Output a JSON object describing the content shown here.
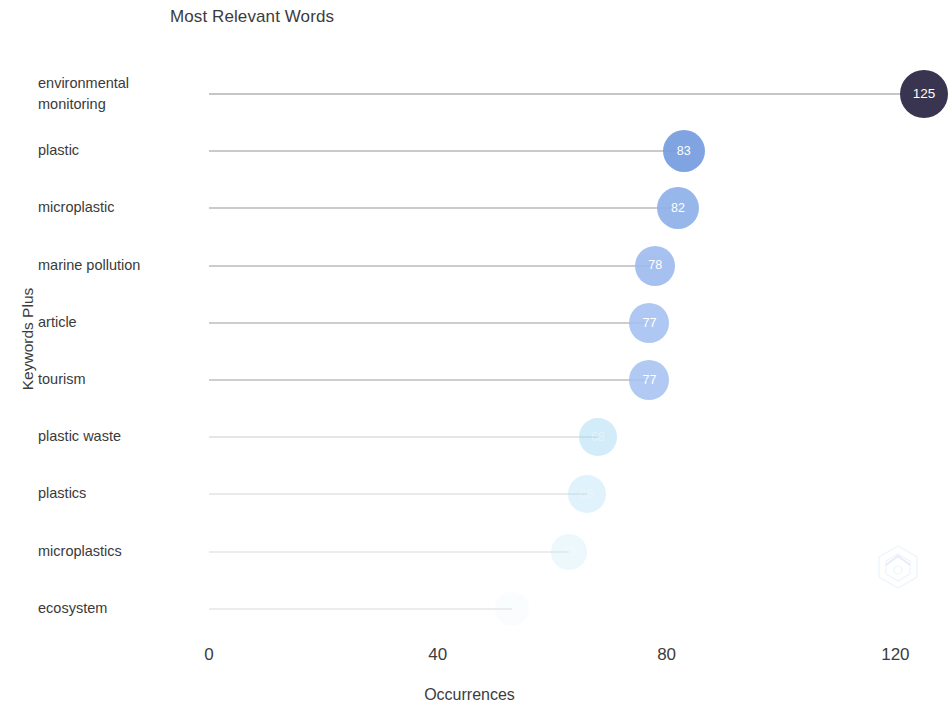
{
  "chart_data": {
    "type": "bar",
    "title": "Most Relevant Words",
    "xlabel": "Occurrences",
    "ylabel": "Keywords Plus",
    "categories": [
      "environmental monitoring",
      "plastic",
      "microplastic",
      "marine pollution",
      "article",
      "tourism",
      "plastic waste",
      "plastics",
      "microplastics",
      "ecosystem"
    ],
    "values": [
      125,
      83,
      82,
      78,
      77,
      77,
      68,
      66,
      63,
      53
    ],
    "value_labels": [
      "125",
      "83",
      "82",
      "78",
      "77",
      "77",
      "68",
      "66",
      "63",
      "53"
    ],
    "xlim": [
      0,
      130
    ],
    "xticks": [
      0,
      40,
      80,
      120
    ],
    "xtick_labels": [
      "0",
      "40",
      "80",
      "120"
    ],
    "grid": false,
    "legend": null,
    "orientation": "horizontal-lollipop",
    "marker_colors": [
      "#39344f",
      "#7a9fe0",
      "#8fb0e8",
      "#9dbbef",
      "#a5c1f2",
      "#a5c1f2",
      "#9fd6f2",
      "#b0def5",
      "#c4e9fa",
      "#ddf3fd"
    ],
    "marker_sizes": [
      24,
      21,
      21,
      20,
      20,
      20,
      19,
      19,
      18,
      17
    ],
    "marker_opacities": [
      1.0,
      0.95,
      0.92,
      0.9,
      0.88,
      0.85,
      0.45,
      0.38,
      0.3,
      0.16
    ],
    "label_opacities": [
      1.0,
      1.0,
      1.0,
      1.0,
      1.0,
      1.0,
      0.35,
      0.28,
      0.22,
      0.1
    ],
    "stem_color": "#8e8e8e",
    "background_color": "#ffffff",
    "text_color": "#3c3c3c"
  },
  "watermark": {
    "name": "hexagon-logo-watermark",
    "visible": true
  }
}
